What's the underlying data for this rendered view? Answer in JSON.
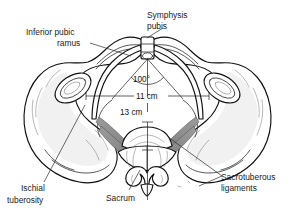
{
  "figure": {
    "background_color": "#ffffff",
    "line_color": "#101010",
    "ligament_color": "#8e8e8e",
    "bone_fill": "#ffffff",
    "bone_shade": "#f1f1f1"
  },
  "labels": {
    "inferior_pubic_ramus": {
      "line1": "Inferior pubic",
      "line2": "ramus"
    },
    "symphysis_pubis": {
      "line1": "Symphysis",
      "line2": "pubis"
    },
    "ischial_tuberosity": {
      "line1": "Ischial",
      "line2": "tuberosity"
    },
    "sacrum": {
      "line1": "Sacrum"
    },
    "sacrotuberous_ligaments": {
      "line1": "Sacrotuberous",
      "line2": "ligaments"
    }
  },
  "measurements": {
    "subpubic_angle": "100°",
    "interspinous_diameter": "11 cm",
    "transverse_diameter": "13 cm"
  }
}
